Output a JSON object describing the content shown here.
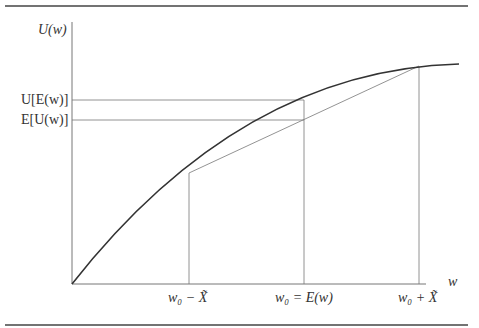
{
  "diagram": {
    "y_axis_label": "U(w)",
    "x_axis_label": "w",
    "y_ticks": [
      "U[E(w)]",
      "E[U(w)]"
    ],
    "x_ticks": [
      "w₀ − X̃",
      "w₀ = E(w)",
      "w₀ + X̃"
    ],
    "colors": {
      "curve": "#333333",
      "lines": "#777777",
      "rule": "#444444"
    }
  }
}
